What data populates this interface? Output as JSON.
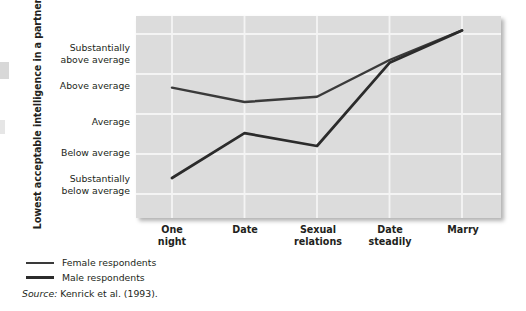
{
  "chart_data": {
    "type": "line",
    "title": "",
    "xlabel": "",
    "ylabel": "Lowest acceptable intelligence\nin a partner",
    "categories": [
      "One night",
      "Date",
      "Sexual relations",
      "Date steadily",
      "Marry"
    ],
    "category_lines": [
      [
        "One",
        "night"
      ],
      [
        "Date"
      ],
      [
        "Sexual",
        "relations"
      ],
      [
        "Date",
        "steadily"
      ],
      [
        "Marry"
      ]
    ],
    "ytick_labels": [
      "Substantially\nabove average",
      "Above average",
      "Average",
      "Below average",
      "Substantially\nbelow average"
    ],
    "ytick_values": [
      2,
      1,
      0,
      -1,
      -2
    ],
    "ylim": [
      -2.6,
      2.45
    ],
    "grid": true,
    "legend_position": "below-left",
    "series": [
      {
        "name": "Female respondents",
        "color": "#3a3a3a",
        "values": [
          0.66,
          0.3,
          0.43,
          1.35,
          2.09
        ]
      },
      {
        "name": "Male respondents",
        "color": "#2b2b2b",
        "values": [
          -1.6,
          -0.48,
          -0.8,
          1.28,
          2.09
        ]
      }
    ],
    "annotations": [],
    "source": "Kenrick et al. (1993).",
    "source_prefix": "Source:"
  },
  "legend": {
    "items": [
      {
        "label": "Female respondents",
        "swatch": "line-swatch-female"
      },
      {
        "label": "Male respondents",
        "swatch": "line-swatch-male"
      }
    ]
  },
  "axis": {
    "y_title": "Lowest acceptable intelligence\nin a partner",
    "y_ticks": [
      "Substantially\nabove average",
      "Above average",
      "Average",
      "Below average",
      "Substantially\nbelow average"
    ],
    "x_ticks": [
      "One\nnight",
      "Date",
      "Sexual\nrelations",
      "Date\nsteadily",
      "Marry"
    ]
  },
  "footer": {
    "source_prefix": "Source:",
    "source_text": "Kenrick et al. (1993)."
  },
  "colors": {
    "plot_background": "#dcdcdc",
    "gridline": "#f4f4f4",
    "female_line": "#3a3a3a",
    "male_line": "#2b2b2b",
    "text": "#231f20"
  }
}
